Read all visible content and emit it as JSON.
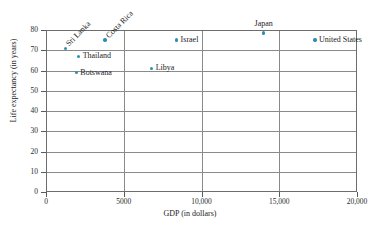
{
  "chart_data": {
    "type": "scatter",
    "title": "",
    "xlabel": "GDP (in dollars)",
    "ylabel": "Life expectancy (in years)",
    "xlim": [
      0,
      20000
    ],
    "ylim": [
      0,
      80
    ],
    "xticks": [
      "0",
      "5000",
      "10,000",
      "15,000",
      "20,000"
    ],
    "xtick_values": [
      0,
      5000,
      10000,
      15000,
      20000
    ],
    "yticks": [
      "0",
      "10",
      "20",
      "30",
      "40",
      "50",
      "60",
      "70",
      "80"
    ],
    "ytick_values": [
      0,
      10,
      20,
      30,
      40,
      50,
      60,
      70,
      80
    ],
    "grid": true,
    "grid_axes": "both",
    "legend": "none",
    "marker_color": "#2e8eb0",
    "points": [
      {
        "label": "Sri Lanka",
        "x": 1250,
        "y": 71.0,
        "label_pos": "rot"
      },
      {
        "label": "Thailand",
        "x": 2100,
        "y": 67.0,
        "label_pos": "right"
      },
      {
        "label": "Botswana",
        "x": 1950,
        "y": 59.0,
        "label_pos": "right"
      },
      {
        "label": "Costa Rica",
        "x": 3800,
        "y": 75.0,
        "label_pos": "rot"
      },
      {
        "label": "Libya",
        "x": 6800,
        "y": 61.0,
        "label_pos": "right"
      },
      {
        "label": "Israel",
        "x": 8400,
        "y": 75.0,
        "label_pos": "right"
      },
      {
        "label": "Japan",
        "x": 14000,
        "y": 78.5,
        "label_pos": "above"
      },
      {
        "label": "United States",
        "x": 17300,
        "y": 75.0,
        "label_pos": "right"
      }
    ]
  }
}
